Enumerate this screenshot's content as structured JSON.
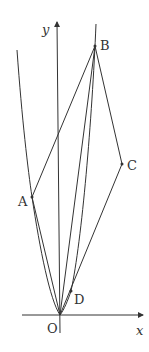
{
  "diagram": {
    "axes": {
      "x_label": "x",
      "y_label": "y",
      "origin_label": "O"
    },
    "points": {
      "A": "A",
      "B": "B",
      "C": "C",
      "D": "D"
    },
    "colors": {
      "stroke": "#333333",
      "background": "#ffffff"
    }
  }
}
